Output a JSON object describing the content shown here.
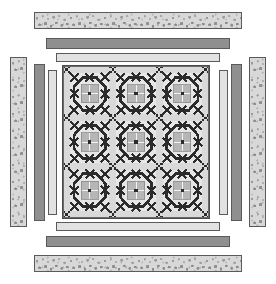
{
  "diagram": {
    "canvas": {
      "width": 276,
      "height": 284,
      "background": "#ffffff"
    }
  },
  "palette": {
    "speckled_fabric": "#d8d8d8",
    "dark_gray_fabric": "#8f8f8f",
    "light_gray_fabric": "#e2e2e2",
    "center_background": "#cfcfcf",
    "sashing": "#d9d9d9",
    "block_ring": "#2b2b2b",
    "block_center": "#b6b6b6",
    "outline": "#4a4a4a"
  },
  "borders": [
    {
      "name": "outer-speckled-border",
      "fabric": "speckled",
      "label": "Outer pieced print border"
    },
    {
      "name": "middle-dark-border",
      "fabric": "dark",
      "label": "Middle dark solid border"
    },
    {
      "name": "inner-light-border",
      "fabric": "light",
      "label": "Inner light solid border"
    }
  ],
  "border_strips": {
    "top_speckled": {
      "x": 34,
      "y": 12,
      "w": 208,
      "h": 17
    },
    "bottom_speckled": {
      "x": 34,
      "y": 255,
      "w": 208,
      "h": 17
    },
    "left_speckled": {
      "x": 10,
      "y": 57,
      "w": 17,
      "h": 170
    },
    "right_speckled": {
      "x": 249,
      "y": 57,
      "w": 17,
      "h": 170
    },
    "top_dark": {
      "x": 46,
      "y": 38,
      "w": 184,
      "h": 11
    },
    "bottom_dark": {
      "x": 46,
      "y": 236,
      "w": 184,
      "h": 11
    },
    "left_dark": {
      "x": 34,
      "y": 64,
      "w": 11,
      "h": 157
    },
    "right_dark": {
      "x": 231,
      "y": 64,
      "w": 11,
      "h": 157
    },
    "top_light": {
      "x": 56,
      "y": 53,
      "w": 164,
      "h": 9
    },
    "bottom_light": {
      "x": 56,
      "y": 222,
      "w": 164,
      "h": 9
    },
    "left_light": {
      "x": 48,
      "y": 70,
      "w": 9,
      "h": 145
    },
    "right_light": {
      "x": 219,
      "y": 70,
      "w": 9,
      "h": 145
    }
  },
  "center": {
    "name": "quilt-center-panel",
    "x": 62,
    "y": 65,
    "w": 148,
    "h": 154,
    "grid_rows": 3,
    "grid_cols": 3,
    "block_count": 9,
    "block_name": "pieced-circle-block",
    "sashing_label": "sashing with nine-patch cornerstones"
  },
  "legend": {
    "rows": "3",
    "cols": "3",
    "blocks": "9",
    "border_count": "3"
  }
}
